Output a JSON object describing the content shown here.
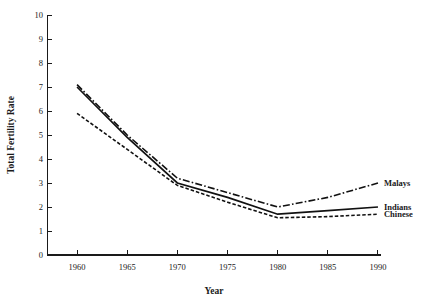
{
  "figure": {
    "top_caption": "",
    "background": "#ffffff",
    "ink_color": "#111111"
  },
  "chart_data": {
    "type": "line",
    "title": "",
    "xlabel": "Year",
    "ylabel": "Total Fertility Rate",
    "x": [
      1960,
      1965,
      1970,
      1975,
      1980,
      1985,
      1990
    ],
    "xlim": [
      1958,
      1991
    ],
    "ylim": [
      0,
      10
    ],
    "xticks": [
      1960,
      1965,
      1970,
      1975,
      1980,
      1985,
      1990
    ],
    "xtick_labels": [
      "1960",
      "1965",
      "1970",
      "1975",
      "1980",
      "1985",
      "1990"
    ],
    "yticks": [
      0,
      1,
      2,
      3,
      4,
      5,
      6,
      7,
      8,
      9,
      10
    ],
    "ytick_labels": [
      "0",
      "1",
      "2",
      "3",
      "4",
      "5",
      "6",
      "7",
      "8",
      "9",
      "10"
    ],
    "grid": false,
    "legend_position": "right-inline-labels",
    "series": [
      {
        "name": "Malays",
        "style": "dash-dot",
        "color": "#111111",
        "values": [
          7.1,
          5.0,
          3.2,
          2.6,
          2.0,
          2.4,
          3.0
        ]
      },
      {
        "name": "Indians",
        "style": "solid",
        "color": "#111111",
        "values": [
          7.0,
          4.9,
          3.0,
          2.4,
          1.7,
          1.85,
          2.0
        ]
      },
      {
        "name": "Chinese",
        "style": "dashed",
        "color": "#111111",
        "values": [
          5.9,
          4.4,
          2.9,
          2.2,
          1.55,
          1.6,
          1.7
        ]
      }
    ]
  }
}
